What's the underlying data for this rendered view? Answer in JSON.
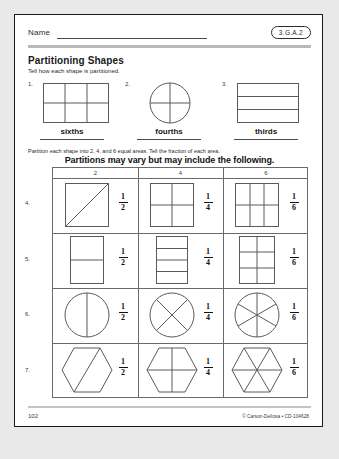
{
  "page": {
    "name_label": "Name",
    "standard_badge": "3.G.A.2",
    "title": "Partitioning Shapes",
    "subtitle": "Tell how each shape is partitioned.",
    "instruction": "Partition each shape into 2, 4, and 6 equal areas. Tell the fraction of each area.",
    "answer_note": "Partitions may vary but may include the following."
  },
  "top_exercises": [
    {
      "number": "1.",
      "answer": "sixths",
      "shape": "rectangle-3x2"
    },
    {
      "number": "2.",
      "answer": "fourths",
      "shape": "circle-quarters"
    },
    {
      "number": "3.",
      "answer": "thirds",
      "shape": "rectangle-3-bands"
    }
  ],
  "table": {
    "column_headers": [
      "2",
      "4",
      "6"
    ],
    "rows": [
      {
        "number": "4.",
        "cells": [
          {
            "shape": "square-diagonal",
            "numerator": "1",
            "denominator": "2"
          },
          {
            "shape": "square-quadrants",
            "numerator": "1",
            "denominator": "4"
          },
          {
            "shape": "square-3x2-grid",
            "numerator": "1",
            "denominator": "6"
          }
        ]
      },
      {
        "number": "5.",
        "cells": [
          {
            "shape": "rect-2-bands",
            "numerator": "1",
            "denominator": "2"
          },
          {
            "shape": "rect-4-bands",
            "numerator": "1",
            "denominator": "4"
          },
          {
            "shape": "rect-2x3-grid",
            "numerator": "1",
            "denominator": "6"
          }
        ]
      },
      {
        "number": "6.",
        "cells": [
          {
            "shape": "circle-halves",
            "numerator": "1",
            "denominator": "2"
          },
          {
            "shape": "circle-x-quarters",
            "numerator": "1",
            "denominator": "4"
          },
          {
            "shape": "circle-sixths",
            "numerator": "1",
            "denominator": "6"
          }
        ]
      },
      {
        "number": "7.",
        "cells": [
          {
            "shape": "hexagon-diagonal",
            "numerator": "1",
            "denominator": "2"
          },
          {
            "shape": "hexagon-cross",
            "numerator": "1",
            "denominator": "4"
          },
          {
            "shape": "hexagon-sixths",
            "numerator": "1",
            "denominator": "6"
          }
        ]
      }
    ]
  },
  "footer": {
    "page_number": "102",
    "copyright": "© Carson-Dellosa • CD-104628"
  },
  "colors": {
    "page_background": "#ffffff",
    "border": "#1a1a1a",
    "rule_bar": "#b9b9b9",
    "shape_stroke": "#5a5a5a",
    "text": "#1a1a1a"
  }
}
